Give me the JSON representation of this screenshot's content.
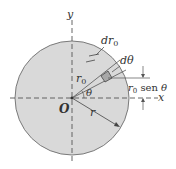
{
  "diagram": {
    "labels": {
      "y_axis": "y",
      "x_axis": "x",
      "origin": "O",
      "theta": "θ",
      "radius": "r",
      "r0": "r",
      "r0_sub": "0",
      "dr0": "dr",
      "dr0_sub": "0",
      "dtheta": "dθ",
      "height_r": "r",
      "height_sub": "0",
      "height_sen": " sen ",
      "height_theta": "θ"
    },
    "colors": {
      "disc_fill": "#d9d9d9",
      "disc_stroke": "#7a7a7a",
      "element_fill": "#a8a8a8",
      "line": "#444444"
    }
  }
}
